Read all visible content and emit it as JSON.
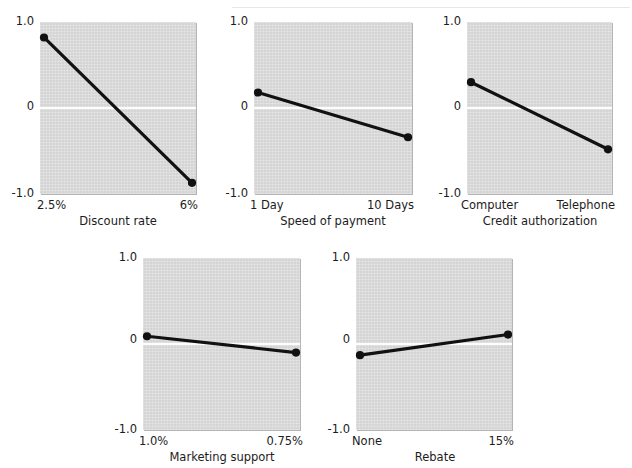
{
  "figure": {
    "width": 632,
    "height": 468,
    "background_color": "#ffffff",
    "panel_face_color": "#d9d9d9",
    "line_color": "#111111",
    "zero_line_color": "#fdfdfd",
    "scan_artifact_text": ""
  },
  "chart_data": [
    {
      "type": "line",
      "title": "",
      "xlabel": "Discount rate",
      "ylabel": "",
      "categories": [
        "2.5%",
        "6%"
      ],
      "x": [
        0,
        1
      ],
      "values": [
        0.82,
        -0.87
      ],
      "ylim": [
        -1.0,
        1.0
      ],
      "yticks": [
        "1.0",
        "0",
        "-1.0"
      ],
      "ytick_values": [
        1.0,
        0,
        -1.0
      ],
      "grid": false,
      "zero_line": true,
      "legend": "none",
      "markers": "filled-circle"
    },
    {
      "type": "line",
      "title": "",
      "xlabel": "Speed of payment",
      "ylabel": "",
      "categories": [
        "1 Day",
        "10 Days"
      ],
      "x": [
        0,
        1
      ],
      "values": [
        0.18,
        -0.34
      ],
      "ylim": [
        -1.0,
        1.0
      ],
      "yticks": [
        "1.0",
        "0",
        "-1.0"
      ],
      "ytick_values": [
        1.0,
        0,
        -1.0
      ],
      "grid": false,
      "zero_line": true,
      "legend": "none",
      "markers": "filled-circle"
    },
    {
      "type": "line",
      "title": "",
      "xlabel": "Credit authorization",
      "ylabel": "",
      "categories": [
        "Computer",
        "Telephone"
      ],
      "x": [
        0,
        1
      ],
      "values": [
        0.3,
        -0.48
      ],
      "ylim": [
        -1.0,
        1.0
      ],
      "yticks": [
        "1.0",
        "0",
        "-1.0"
      ],
      "ytick_values": [
        1.0,
        0,
        -1.0
      ],
      "grid": false,
      "zero_line": true,
      "legend": "none",
      "markers": "filled-circle"
    },
    {
      "type": "line",
      "title": "",
      "xlabel": "Marketing support",
      "ylabel": "",
      "categories": [
        "1.0%",
        "0.75%"
      ],
      "x": [
        0,
        1
      ],
      "values": [
        0.09,
        -0.1
      ],
      "ylim": [
        -1.0,
        1.0
      ],
      "yticks": [
        "1.0",
        "0",
        "-1.0"
      ],
      "ytick_values": [
        1.0,
        0,
        -1.0
      ],
      "grid": false,
      "zero_line": true,
      "legend": "none",
      "markers": "filled-circle"
    },
    {
      "type": "line",
      "title": "",
      "xlabel": "Rebate",
      "ylabel": "",
      "categories": [
        "None",
        "15%"
      ],
      "x": [
        0,
        1
      ],
      "values": [
        -0.13,
        0.11
      ],
      "ylim": [
        -1.0,
        1.0
      ],
      "yticks": [
        "1.0",
        "0",
        "-1.0"
      ],
      "ytick_values": [
        1.0,
        0,
        -1.0
      ],
      "grid": false,
      "zero_line": true,
      "legend": "none",
      "markers": "filled-circle"
    }
  ],
  "panels": [
    {
      "name": "discount-rate",
      "xlabel": "Discount rate",
      "ytick_top": "1.0",
      "ytick_mid": "0",
      "ytick_bottom": "-1.0",
      "xtick_left": "2.5%",
      "xtick_right": "6%"
    },
    {
      "name": "speed-of-payment",
      "xlabel": "Speed of payment",
      "ytick_top": "1.0",
      "ytick_mid": "0",
      "ytick_bottom": "-1.0",
      "xtick_left": "1 Day",
      "xtick_right": "10 Days"
    },
    {
      "name": "credit-authorization",
      "xlabel": "Credit authorization",
      "ytick_top": "1.0",
      "ytick_mid": "0",
      "ytick_bottom": "-1.0",
      "xtick_left": "Computer",
      "xtick_right": "Telephone"
    },
    {
      "name": "marketing-support",
      "xlabel": "Marketing support",
      "ytick_top": "1.0",
      "ytick_mid": "0",
      "ytick_bottom": "-1.0",
      "xtick_left": "1.0%",
      "xtick_right": "0.75%"
    },
    {
      "name": "rebate",
      "xlabel": "Rebate",
      "ytick_top": "1.0",
      "ytick_mid": "0",
      "ytick_bottom": "-1.0",
      "xtick_left": "None",
      "xtick_right": "15%"
    }
  ]
}
